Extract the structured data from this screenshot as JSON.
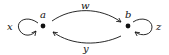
{
  "diagram": {
    "type": "directed-graph",
    "nodes": [
      {
        "id": "a",
        "label": "a",
        "x": 43,
        "y": 26
      },
      {
        "id": "b",
        "label": "b",
        "x": 128,
        "y": 26
      }
    ],
    "edges": [
      {
        "from": "a",
        "to": "a",
        "label": "x",
        "kind": "self-loop",
        "side": "left"
      },
      {
        "from": "a",
        "to": "b",
        "label": "w",
        "kind": "arc",
        "side": "top"
      },
      {
        "from": "b",
        "to": "a",
        "label": "y",
        "kind": "arc",
        "side": "bottom"
      },
      {
        "from": "b",
        "to": "b",
        "label": "z",
        "kind": "self-loop",
        "side": "right"
      }
    ],
    "colors": {
      "ink": "#111111",
      "background": "#ffffff"
    }
  }
}
